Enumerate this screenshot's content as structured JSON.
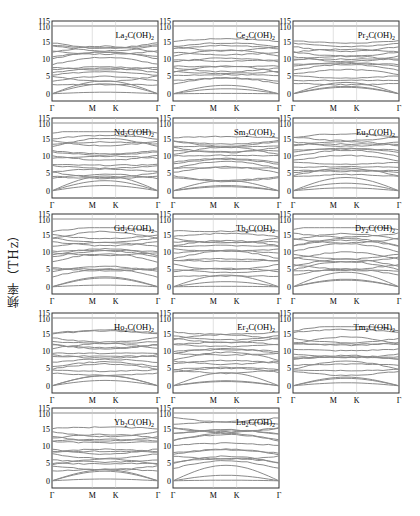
{
  "figure": {
    "ylabel": "频率（THz）",
    "kpath": [
      "Γ",
      "M",
      "K",
      "Γ"
    ]
  },
  "chart_data": {
    "type": "line",
    "xlabel": "",
    "ylabel": "频率（THz）",
    "x_ticks": [
      "Γ",
      "M",
      "K",
      "Γ"
    ],
    "y_ticks": [
      0,
      5,
      10,
      15,
      110,
      115
    ],
    "axis_break": "y-axis broken between ~18 and 110 THz",
    "panels": [
      {
        "name": "La₂C(OH)₂",
        "sub": "2",
        "base": "La",
        "sub2": "2",
        "ymax_low": 16,
        "top_band": 110
      },
      {
        "name": "Ce₂C(OH)₂",
        "sub": "2",
        "base": "Ce",
        "sub2": "2",
        "ymax_low": 16,
        "top_band": 110
      },
      {
        "name": "Pr₂C(OH)₂",
        "sub": "2",
        "base": "Pr",
        "sub2": "2",
        "ymax_low": 16,
        "top_band": 110
      },
      {
        "name": "Nd₂C(OH)₂",
        "sub": "2",
        "base": "Nd",
        "sub2": "2",
        "ymax_low": 17,
        "top_band": 110
      },
      {
        "name": "Sm₂C(OH)₂",
        "sub": "2",
        "base": "Sm",
        "sub2": "2",
        "ymax_low": 17,
        "top_band": 110
      },
      {
        "name": "Eu₂C(OH)₂",
        "sub": "2",
        "base": "Eu",
        "sub2": "2",
        "ymax_low": 17,
        "top_band": 110
      },
      {
        "name": "Gd₂C(OH)₂",
        "sub": "2",
        "base": "Gd",
        "sub2": "2",
        "ymax_low": 17,
        "top_band": 110
      },
      {
        "name": "Tb₂C(OH)₂",
        "sub": "2",
        "base": "Tb",
        "sub2": "2",
        "ymax_low": 17,
        "top_band": 110
      },
      {
        "name": "Dy₂C(OH)₂",
        "sub": "2",
        "base": "Dy",
        "sub2": "2",
        "ymax_low": 17,
        "top_band": 110
      },
      {
        "name": "Ho₂C(OH)₂",
        "sub": "2",
        "base": "Ho",
        "sub2": "2",
        "ymax_low": 17,
        "top_band": 110
      },
      {
        "name": "Er₂C(OH)₂",
        "sub": "2",
        "base": "Er",
        "sub2": "2",
        "ymax_low": 17,
        "top_band": 110
      },
      {
        "name": "Tm₂C(OH)₂",
        "sub": "2",
        "base": "Tm",
        "sub2": "2",
        "ymax_low": 17,
        "top_band": 110
      },
      {
        "name": "Yb₂C(OH)₂",
        "sub": "2",
        "base": "Yb",
        "sub2": "2",
        "ymax_low": 16,
        "top_band": 110
      },
      {
        "name": "Lu₂C(OH)₂",
        "sub": "2",
        "base": "Lu",
        "sub2": "2",
        "ymax_low": 19,
        "top_band": 110
      }
    ],
    "grid": {
      "vertical_lines_at": [
        "M",
        "K"
      ],
      "horizontal": false
    },
    "line_color": "#8a8a8a"
  }
}
